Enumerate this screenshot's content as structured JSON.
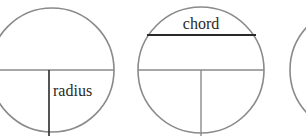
{
  "diagram": {
    "stroke_color": "#8a8a8a",
    "ink_color": "#2a2a2a",
    "circles": [
      {
        "id": "circle-radius",
        "label": "radius",
        "feature": "radius"
      },
      {
        "id": "circle-chord",
        "label": "chord",
        "feature": "chord"
      },
      {
        "id": "circle-partial",
        "label": "",
        "feature": "partially visible"
      }
    ]
  }
}
